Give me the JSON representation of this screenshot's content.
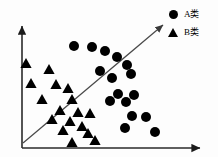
{
  "figure": {
    "title": "",
    "background_color": "#fdfdfd",
    "ink_color": "#000000"
  },
  "legend": {
    "position": "top-right",
    "entries": [
      {
        "marker": "circle-marker-icon",
        "label": "A类"
      },
      {
        "marker": "triangle-marker-icon",
        "label": "B类"
      }
    ]
  },
  "axes": {
    "x_axis": {
      "name": "x-axis",
      "label": "",
      "arrow": true,
      "x1": 22,
      "y1": 148,
      "x2": 200,
      "y2": 148
    },
    "y_axis": {
      "name": "y-axis",
      "label": "",
      "arrow": true,
      "x1": 22,
      "y1": 148,
      "x2": 22,
      "y2": 26
    }
  },
  "decision_boundary": {
    "name": "decision-boundary-line",
    "arrow": true,
    "x1": 23,
    "y1": 143,
    "x2": 163,
    "y2": 25
  },
  "chart_data": {
    "type": "scatter",
    "title": "",
    "xlabel": "",
    "ylabel": "",
    "xlim": [
      0,
      218
    ],
    "ylim": [
      0,
      157
    ],
    "grid": false,
    "legend_position": "top-right",
    "annotations": [
      {
        "type": "line",
        "label": "separating line with arrow",
        "from": [
          23,
          143
        ],
        "to": [
          163,
          25
        ]
      }
    ],
    "series": [
      {
        "name": "A类",
        "marker": "circle",
        "color": "#000000",
        "count": 16,
        "points": [
          [
            74,
            46
          ],
          [
            92,
            47
          ],
          [
            105,
            51
          ],
          [
            117,
            57
          ],
          [
            127,
            65
          ],
          [
            100,
            71
          ],
          [
            112,
            78
          ],
          [
            131,
            74
          ],
          [
            118,
            94
          ],
          [
            134,
            95
          ],
          [
            110,
            101
          ],
          [
            126,
            102
          ],
          [
            132,
            116
          ],
          [
            146,
            117
          ],
          [
            125,
            128
          ],
          [
            155,
            132
          ]
        ]
      },
      {
        "name": "B类",
        "marker": "triangle",
        "color": "#000000",
        "count": 17,
        "points": [
          [
            26,
            63
          ],
          [
            49,
            69
          ],
          [
            31,
            83
          ],
          [
            56,
            84
          ],
          [
            68,
            88
          ],
          [
            42,
            99
          ],
          [
            72,
            99
          ],
          [
            60,
            110
          ],
          [
            78,
            112
          ],
          [
            90,
            113
          ],
          [
            52,
            119
          ],
          [
            70,
            121
          ],
          [
            82,
            126
          ],
          [
            63,
            130
          ],
          [
            88,
            133
          ],
          [
            72,
            142
          ],
          [
            95,
            140
          ]
        ]
      }
    ]
  }
}
